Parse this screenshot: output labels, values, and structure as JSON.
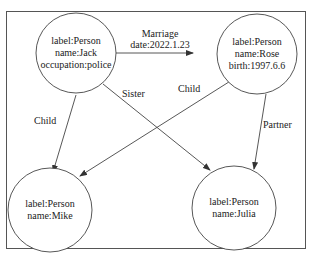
{
  "diagram": {
    "type": "knowledge-graph",
    "nodes": [
      {
        "id": "jack",
        "lines": [
          "label:Person",
          "name:Jack",
          "occupation:police"
        ]
      },
      {
        "id": "rose",
        "lines": [
          "label:Person",
          "name:Rose",
          "birth:1997.6.6"
        ]
      },
      {
        "id": "mike",
        "lines": [
          "label:Person",
          "name:Mike"
        ]
      },
      {
        "id": "julia",
        "lines": [
          "label:Person",
          "name:Julia"
        ]
      }
    ],
    "edges": [
      {
        "from": "jack",
        "to": "rose",
        "label_lines": [
          "Marriage",
          "date:2022.1.23"
        ]
      },
      {
        "from": "jack",
        "to": "mike",
        "label_lines": [
          "Child"
        ]
      },
      {
        "from": "jack",
        "to": "julia",
        "label_lines": [
          "Sister"
        ]
      },
      {
        "from": "rose",
        "to": "mike",
        "label_lines": [
          "Child"
        ]
      },
      {
        "from": "rose",
        "to": "julia",
        "label_lines": [
          "Partner"
        ]
      }
    ]
  }
}
